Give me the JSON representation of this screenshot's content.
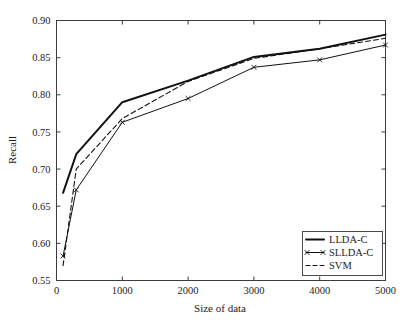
{
  "chart_data": {
    "type": "line",
    "title": "",
    "xlabel": "Size of data",
    "ylabel": "Recall",
    "xlim": [
      0,
      5000
    ],
    "ylim": [
      0.55,
      0.9
    ],
    "grid": false,
    "legend_position": "lower right",
    "xticks": [
      "0",
      "1000",
      "2000",
      "3000",
      "4000",
      "5000"
    ],
    "xtick_values": [
      0,
      1000,
      2000,
      3000,
      4000,
      5000
    ],
    "yticks": [
      "0.55",
      "0.60",
      "0.65",
      "0.70",
      "0.75",
      "0.80",
      "0.85",
      "0.90"
    ],
    "ytick_values": [
      0.55,
      0.6,
      0.65,
      0.7,
      0.75,
      0.8,
      0.85,
      0.9
    ],
    "x": [
      100,
      300,
      1000,
      2000,
      3000,
      4000,
      5000
    ],
    "series": [
      {
        "name": "LLDA-C",
        "style": "solid-thick",
        "marker": "none",
        "color": "#111111",
        "values": [
          0.668,
          0.72,
          0.79,
          0.819,
          0.851,
          0.862,
          0.881
        ]
      },
      {
        "name": "SLLDA-C",
        "style": "solid-thin",
        "marker": "x",
        "color": "#111111",
        "values": [
          0.583,
          0.672,
          0.763,
          0.795,
          0.837,
          0.847,
          0.867
        ]
      },
      {
        "name": "SVM",
        "style": "dashed",
        "marker": "none",
        "color": "#111111",
        "values": [
          0.57,
          0.7,
          0.768,
          0.818,
          0.849,
          0.862,
          0.876
        ]
      }
    ]
  },
  "legend": {
    "items": [
      {
        "label": "LLDA-C"
      },
      {
        "label": "SLLDA-C"
      },
      {
        "label": "SVM"
      }
    ]
  }
}
